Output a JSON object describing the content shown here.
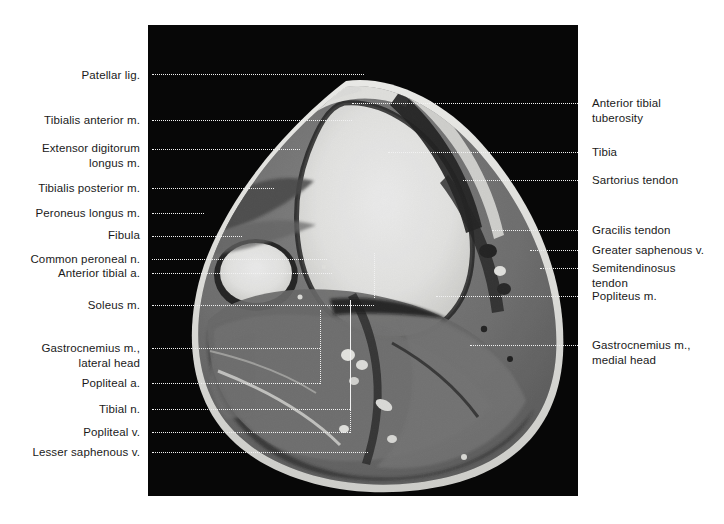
{
  "figure": {
    "kind": "axial-MRI-anatomy-plate",
    "region": "right knee / proximal leg, axial section",
    "image_background": "#050505",
    "page_background": "#ffffff",
    "label_color": "#1a1a1a",
    "leader_color_on_white": "#2b2b2b",
    "leader_color_on_black": "#f2f2f2"
  },
  "labels_left": [
    {
      "text": "Patellar lig.",
      "x": 148,
      "y": 68,
      "lines": 1
    },
    {
      "text": "Tibialis anterior m.",
      "x": 148,
      "y": 113,
      "lines": 1
    },
    {
      "text": "Extensor digitorum\nlongus m.",
      "x": 148,
      "y": 141,
      "lines": 2
    },
    {
      "text": "Tibialis posterior m.",
      "x": 148,
      "y": 181,
      "lines": 1
    },
    {
      "text": "Peroneus longus m.",
      "x": 148,
      "y": 206,
      "lines": 1
    },
    {
      "text": "Fibula",
      "x": 148,
      "y": 228,
      "lines": 1
    },
    {
      "text": "Common peroneal n.",
      "x": 148,
      "y": 252,
      "lines": 1
    },
    {
      "text": "Anterior tibial a.",
      "x": 148,
      "y": 266,
      "lines": 1
    },
    {
      "text": "Soleus m.",
      "x": 148,
      "y": 298,
      "lines": 1
    },
    {
      "text": "Gastrocnemius m.,\nlateral head",
      "x": 148,
      "y": 341,
      "lines": 2
    },
    {
      "text": "Popliteal a.",
      "x": 148,
      "y": 376,
      "lines": 1
    },
    {
      "text": "Tibial n.",
      "x": 148,
      "y": 402,
      "lines": 1
    },
    {
      "text": "Popliteal v.",
      "x": 148,
      "y": 425,
      "lines": 1
    },
    {
      "text": "Lesser saphenous v.",
      "x": 148,
      "y": 445,
      "lines": 1
    }
  ],
  "labels_right": [
    {
      "text": "Anterior tibial\n   tuberosity",
      "x": 592,
      "y": 96,
      "lines": 2
    },
    {
      "text": "Tibia",
      "x": 592,
      "y": 145,
      "lines": 1
    },
    {
      "text": "Sartorius tendon",
      "x": 592,
      "y": 173,
      "lines": 1
    },
    {
      "text": "Gracilis tendon",
      "x": 592,
      "y": 223,
      "lines": 1
    },
    {
      "text": "Greater saphenous v.",
      "x": 592,
      "y": 243,
      "lines": 1
    },
    {
      "text": "Semitendinosus\n   tendon",
      "x": 592,
      "y": 261,
      "lines": 2
    },
    {
      "text": "Popliteus m.",
      "x": 592,
      "y": 289,
      "lines": 1
    }
  ],
  "labels_right_lower": [
    {
      "text": "Gastrocnemius m.,\n   medial head",
      "x": 592,
      "y": 338,
      "lines": 2
    }
  ],
  "leaders_left": [
    {
      "name": "leader-patellar-lig",
      "x": 152,
      "y": 74,
      "w": 212,
      "dark": true
    },
    {
      "name": "leader-tibialis-anterior",
      "x": 152,
      "y": 120,
      "w": 200,
      "dark": true
    },
    {
      "name": "leader-extensor-digitorum",
      "x": 152,
      "y": 149,
      "w": 148,
      "dark": true
    },
    {
      "name": "leader-tibialis-posterior",
      "x": 152,
      "y": 188,
      "w": 122,
      "dark": true
    },
    {
      "name": "leader-peroneus-longus",
      "x": 152,
      "y": 213,
      "w": 52,
      "dark": true
    },
    {
      "name": "leader-fibula",
      "x": 152,
      "y": 236,
      "w": 90,
      "dark": true
    },
    {
      "name": "leader-common-peroneal-n",
      "x": 152,
      "y": 259,
      "w": 175,
      "dark": true
    },
    {
      "name": "leader-anterior-tibial-a",
      "x": 152,
      "y": 273,
      "w": 180,
      "dark": true
    },
    {
      "name": "leader-soleus-m",
      "x": 152,
      "y": 305,
      "w": 222,
      "dark": true
    },
    {
      "name": "leader-gastroc-lateral",
      "x": 152,
      "y": 348,
      "w": 168,
      "dark": true
    },
    {
      "name": "leader-popliteal-a",
      "x": 152,
      "y": 383,
      "w": 168,
      "dark": true
    },
    {
      "name": "leader-tibial-n",
      "x": 152,
      "y": 409,
      "w": 198,
      "dark": true
    },
    {
      "name": "leader-popliteal-v",
      "x": 152,
      "y": 432,
      "w": 198,
      "dark": true
    },
    {
      "name": "leader-lesser-saphenous-v",
      "x": 152,
      "y": 452,
      "w": 216,
      "dark": true
    }
  ],
  "leaders_right": [
    {
      "name": "leader-anterior-tibial-tuberosity",
      "x": 352,
      "y": 103,
      "w": 238
    },
    {
      "name": "leader-tibia",
      "x": 388,
      "y": 152,
      "w": 202
    },
    {
      "name": "leader-sartorius-tendon",
      "x": 463,
      "y": 180,
      "w": 127
    },
    {
      "name": "leader-gracilis-tendon",
      "x": 492,
      "y": 230,
      "w": 98
    },
    {
      "name": "leader-greater-saphenous-v",
      "x": 530,
      "y": 250,
      "w": 60
    },
    {
      "name": "leader-semitendinosus-tendon",
      "x": 540,
      "y": 268,
      "w": 50
    },
    {
      "name": "leader-popliteus-m",
      "x": 436,
      "y": 296,
      "w": 154
    },
    {
      "name": "leader-gastroc-medial",
      "x": 470,
      "y": 345,
      "w": 120
    }
  ],
  "leaders_vertical": [
    {
      "name": "leader-v-popliteal-a",
      "x": 320,
      "y": 310,
      "h": 74
    },
    {
      "name": "leader-v-tibial-n",
      "x": 350,
      "y": 300,
      "h": 110
    },
    {
      "name": "leader-v-popliteal-v",
      "x": 350,
      "y": 300,
      "h": 133
    },
    {
      "name": "leader-v-sartorius",
      "x": 374,
      "y": 253,
      "h": 45
    }
  ],
  "alt": "Axial magnetic resonance image through the proximal right leg just below the knee, with dotted leader lines identifying muscles, bones, tendons, arteries, veins and nerves."
}
